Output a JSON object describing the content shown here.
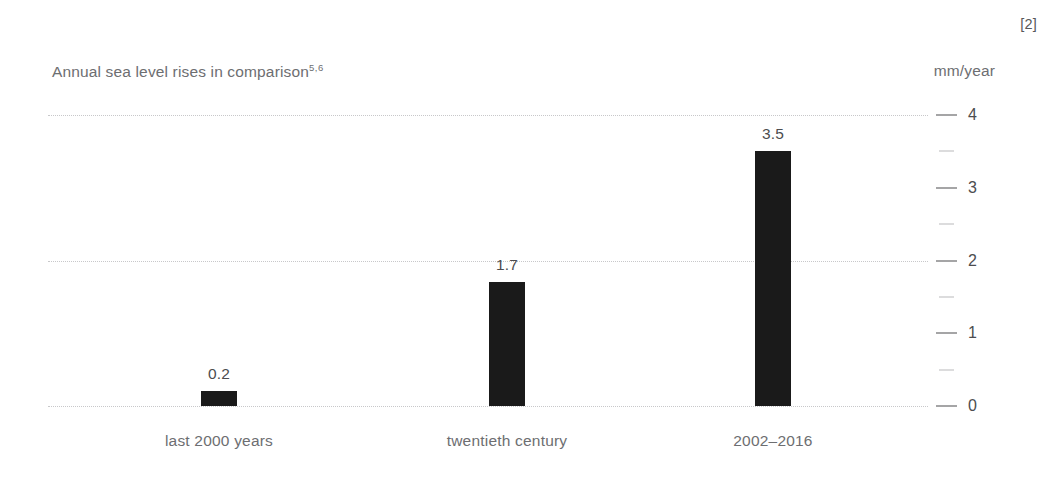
{
  "reference_marker": "[2]",
  "chart_data": {
    "type": "bar",
    "title": "Annual sea level rises in comparison",
    "title_superscript": "5,6",
    "subtitle": "",
    "xlabel": "",
    "ylabel": "mm/year",
    "unit_label": "mm/year",
    "categories": [
      "last 2000 years",
      "twentieth century",
      "2002–2016"
    ],
    "values": [
      0.2,
      1.7,
      3.5
    ],
    "value_labels": [
      "0.2",
      "1.7",
      "3.5"
    ],
    "ylim": [
      0,
      4
    ],
    "major_ticks": [
      0,
      1,
      2,
      3,
      4
    ],
    "major_tick_labels": [
      "0",
      "1",
      "2",
      "3",
      "4"
    ],
    "minor_ticks": [
      0.5,
      1.5,
      2.5,
      3.5
    ],
    "gridlines": [
      0,
      2,
      4
    ],
    "grid": true,
    "legend": "none",
    "bar_color": "#1a1a1a",
    "grid_color": "#c8c8ca",
    "text_color": "#6d6e71"
  }
}
